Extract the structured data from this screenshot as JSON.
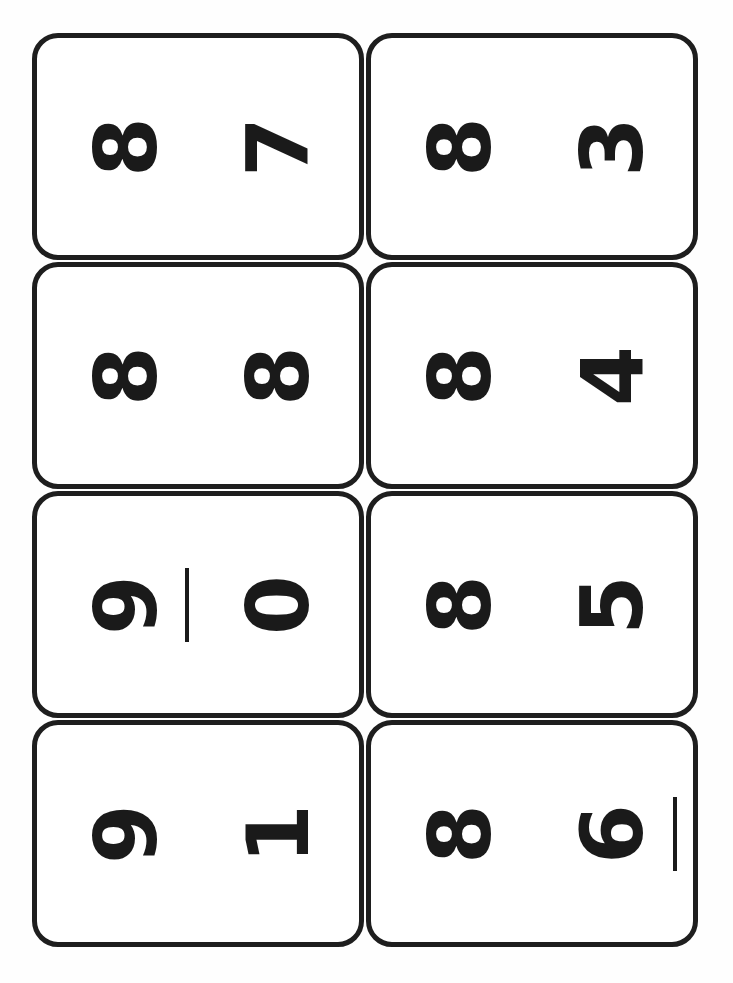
{
  "sheet": {
    "title": "Number Flashcards",
    "background_color": "#fefefe",
    "card_border_color": "#1e1e1e",
    "digit_color": "#1a1a1a",
    "rows": 4,
    "columns": 2,
    "orientation_note": "Cards printed sideways; digits rotated 90 degrees counter-clockwise",
    "card_count": 8
  },
  "cards": [
    {
      "position": "row1-col1",
      "first_digit": "8",
      "second_digit": "7",
      "first_underlined": false,
      "second_underlined": false,
      "pair_text": "8 7"
    },
    {
      "position": "row1-col2",
      "first_digit": "8",
      "second_digit": "3",
      "first_underlined": false,
      "second_underlined": false,
      "pair_text": "8 3"
    },
    {
      "position": "row2-col1",
      "first_digit": "8",
      "second_digit": "8",
      "first_underlined": false,
      "second_underlined": false,
      "pair_text": "8 8"
    },
    {
      "position": "row2-col2",
      "first_digit": "8",
      "second_digit": "4",
      "first_underlined": false,
      "second_underlined": false,
      "pair_text": "8 4"
    },
    {
      "position": "row3-col1",
      "first_digit": "9",
      "second_digit": "0",
      "first_underlined": true,
      "second_underlined": false,
      "pair_text": "9 0"
    },
    {
      "position": "row3-col2",
      "first_digit": "8",
      "second_digit": "5",
      "first_underlined": false,
      "second_underlined": false,
      "pair_text": "8 5"
    },
    {
      "position": "row4-col1",
      "first_digit": "9",
      "second_digit": "1",
      "first_underlined": false,
      "second_underlined": false,
      "pair_text": "9 1"
    },
    {
      "position": "row4-col2",
      "first_digit": "8",
      "second_digit": "6",
      "first_underlined": false,
      "second_underlined": true,
      "pair_text": "8 6"
    }
  ]
}
